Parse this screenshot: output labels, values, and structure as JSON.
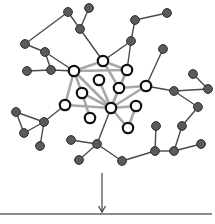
{
  "diagram": {
    "colors": {
      "background": "#ffffff",
      "periphery_node_fill": "#5a5a5a",
      "periphery_node_stroke": "#2e2e2e",
      "core_node_fill": "#ffffff",
      "core_node_stroke": "#111111",
      "periphery_edge": "#4a4a4a",
      "core_edge": "#a8a8a8",
      "arrow": "#444444",
      "baseline": "#666666"
    },
    "nodes": [
      {
        "id": "c1",
        "type": "core",
        "x": 74,
        "y": 71
      },
      {
        "id": "c2",
        "type": "core",
        "x": 103,
        "y": 61
      },
      {
        "id": "c3",
        "type": "core",
        "x": 127,
        "y": 70
      },
      {
        "id": "c4",
        "type": "core",
        "x": 99,
        "y": 80
      },
      {
        "id": "c5",
        "type": "core",
        "x": 82,
        "y": 93
      },
      {
        "id": "c6",
        "type": "core",
        "x": 119,
        "y": 88
      },
      {
        "id": "c7",
        "type": "core",
        "x": 146,
        "y": 86
      },
      {
        "id": "c8",
        "type": "core",
        "x": 65,
        "y": 105
      },
      {
        "id": "c9",
        "type": "core",
        "x": 111,
        "y": 108
      },
      {
        "id": "c10",
        "type": "core",
        "x": 136,
        "y": 106
      },
      {
        "id": "c11",
        "type": "core",
        "x": 90,
        "y": 118
      },
      {
        "id": "c12",
        "type": "core",
        "x": 128,
        "y": 128
      },
      {
        "id": "p1",
        "type": "periphery",
        "x": 68,
        "y": 12
      },
      {
        "id": "p2",
        "type": "periphery",
        "x": 89,
        "y": 8
      },
      {
        "id": "p3",
        "type": "periphery",
        "x": 80,
        "y": 29
      },
      {
        "id": "p4",
        "type": "periphery",
        "x": 25,
        "y": 44
      },
      {
        "id": "p5",
        "type": "periphery",
        "x": 45,
        "y": 52
      },
      {
        "id": "p6",
        "type": "periphery",
        "x": 27,
        "y": 71
      },
      {
        "id": "p7",
        "type": "periphery",
        "x": 51,
        "y": 70
      },
      {
        "id": "p8",
        "type": "periphery",
        "x": 135,
        "y": 20
      },
      {
        "id": "p9",
        "type": "periphery",
        "x": 167,
        "y": 13
      },
      {
        "id": "p10",
        "type": "periphery",
        "x": 131,
        "y": 41
      },
      {
        "id": "p11",
        "type": "periphery",
        "x": 163,
        "y": 49
      },
      {
        "id": "p12",
        "type": "periphery",
        "x": 174,
        "y": 91
      },
      {
        "id": "p13",
        "type": "periphery",
        "x": 193,
        "y": 74
      },
      {
        "id": "p14",
        "type": "periphery",
        "x": 208,
        "y": 89
      },
      {
        "id": "p15",
        "type": "periphery",
        "x": 198,
        "y": 107
      },
      {
        "id": "p16",
        "type": "periphery",
        "x": 182,
        "y": 126
      },
      {
        "id": "p17",
        "type": "periphery",
        "x": 156,
        "y": 126
      },
      {
        "id": "p18",
        "type": "periphery",
        "x": 155,
        "y": 151
      },
      {
        "id": "p19",
        "type": "periphery",
        "x": 174,
        "y": 151
      },
      {
        "id": "p20",
        "type": "periphery",
        "x": 201,
        "y": 144
      },
      {
        "id": "p21",
        "type": "periphery",
        "x": 122,
        "y": 161
      },
      {
        "id": "p22",
        "type": "periphery",
        "x": 97,
        "y": 144
      },
      {
        "id": "p23",
        "type": "periphery",
        "x": 71,
        "y": 140
      },
      {
        "id": "p24",
        "type": "periphery",
        "x": 79,
        "y": 160
      },
      {
        "id": "p25",
        "type": "periphery",
        "x": 44,
        "y": 122
      },
      {
        "id": "p26",
        "type": "periphery",
        "x": 16,
        "y": 112
      },
      {
        "id": "p27",
        "type": "periphery",
        "x": 24,
        "y": 133
      },
      {
        "id": "p28",
        "type": "periphery",
        "x": 40,
        "y": 146
      }
    ],
    "edges": [
      [
        "c1",
        "c2",
        "core"
      ],
      [
        "c1",
        "c3",
        "core"
      ],
      [
        "c2",
        "c3",
        "core"
      ],
      [
        "c1",
        "c8",
        "core"
      ],
      [
        "c1",
        "c5",
        "core"
      ],
      [
        "c1",
        "c9",
        "core"
      ],
      [
        "c4",
        "c9",
        "core"
      ],
      [
        "c5",
        "c9",
        "core"
      ],
      [
        "c5",
        "c11",
        "core"
      ],
      [
        "c8",
        "c9",
        "core"
      ],
      [
        "c2",
        "c6",
        "core"
      ],
      [
        "c3",
        "c6",
        "core"
      ],
      [
        "c3",
        "c9",
        "core"
      ],
      [
        "c6",
        "c9",
        "core"
      ],
      [
        "c6",
        "c7",
        "core"
      ],
      [
        "c9",
        "c7",
        "core"
      ],
      [
        "c9",
        "c10",
        "core"
      ],
      [
        "c10",
        "c12",
        "core"
      ],
      [
        "c9",
        "c12",
        "core"
      ],
      [
        "p1",
        "p4",
        "periphery"
      ],
      [
        "p1",
        "p3",
        "periphery"
      ],
      [
        "p2",
        "p3",
        "periphery"
      ],
      [
        "p3",
        "c2",
        "periphery"
      ],
      [
        "p4",
        "p5",
        "periphery"
      ],
      [
        "p5",
        "p7",
        "periphery"
      ],
      [
        "p5",
        "c1",
        "periphery"
      ],
      [
        "p6",
        "p7",
        "periphery"
      ],
      [
        "p7",
        "c1",
        "periphery"
      ],
      [
        "p8",
        "p9",
        "periphery"
      ],
      [
        "p8",
        "p10",
        "periphery"
      ],
      [
        "p10",
        "c2",
        "periphery"
      ],
      [
        "p10",
        "c3",
        "periphery"
      ],
      [
        "p11",
        "c7",
        "periphery"
      ],
      [
        "c7",
        "p12",
        "periphery"
      ],
      [
        "p12",
        "p14",
        "periphery"
      ],
      [
        "p13",
        "p14",
        "periphery"
      ],
      [
        "p12",
        "p15",
        "periphery"
      ],
      [
        "p15",
        "p16",
        "periphery"
      ],
      [
        "p16",
        "p19",
        "periphery"
      ],
      [
        "p19",
        "p20",
        "periphery"
      ],
      [
        "p19",
        "p18",
        "periphery"
      ],
      [
        "p17",
        "p18",
        "periphery"
      ],
      [
        "p18",
        "p21",
        "periphery"
      ],
      [
        "p21",
        "p22",
        "periphery"
      ],
      [
        "p22",
        "c9",
        "periphery"
      ],
      [
        "p22",
        "p23",
        "periphery"
      ],
      [
        "p22",
        "p24",
        "periphery"
      ],
      [
        "c8",
        "p25",
        "periphery"
      ],
      [
        "p25",
        "p26",
        "periphery"
      ],
      [
        "p25",
        "p27",
        "periphery"
      ],
      [
        "p26",
        "p27",
        "periphery"
      ],
      [
        "p25",
        "p28",
        "periphery"
      ]
    ],
    "arrow": {
      "x": 102,
      "y1": 173,
      "y2": 212
    },
    "baseline": {
      "y": 214,
      "x1": 0,
      "x2": 212
    }
  }
}
